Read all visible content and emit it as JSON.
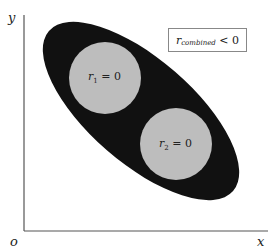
{
  "axes": {
    "y_label": "y",
    "x_label": "x",
    "origin_label": "o"
  },
  "legend_box": {
    "var": "r",
    "subscript": "combined",
    "relation": "< 0"
  },
  "circles": [
    {
      "label_var": "r",
      "label_sub": "1",
      "label_rel": "= 0"
    },
    {
      "label_var": "r",
      "label_sub": "2",
      "label_rel": "= 0"
    }
  ],
  "colors": {
    "ellipse": "#111111",
    "circle": "#bdbdbd",
    "axis": "#555555"
  }
}
